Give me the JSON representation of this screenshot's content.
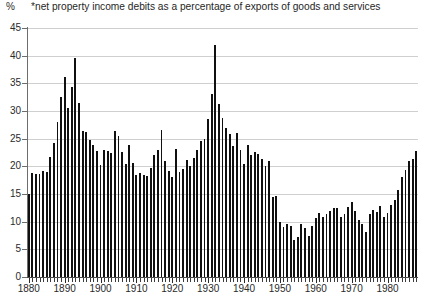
{
  "header": {
    "unit_label": "%",
    "title": "*net property income debits as a percentage of exports of goods and services"
  },
  "axes": {
    "y_ticks": [
      0,
      5,
      10,
      15,
      20,
      25,
      30,
      35,
      40,
      45
    ],
    "x_ticks": [
      1880,
      1890,
      1900,
      1910,
      1920,
      1930,
      1940,
      1950,
      1960,
      1970,
      1980
    ]
  },
  "chart_data": {
    "type": "bar",
    "title": "*net property income debits as a percentage of exports of goods and services",
    "xlabel": "",
    "ylabel": "%",
    "ylim": [
      0,
      45
    ],
    "xlim": [
      1880,
      1989
    ],
    "grid": true,
    "legend": "none",
    "categories": [
      1880,
      1881,
      1882,
      1883,
      1884,
      1885,
      1886,
      1887,
      1888,
      1889,
      1890,
      1891,
      1892,
      1893,
      1894,
      1895,
      1896,
      1897,
      1898,
      1899,
      1900,
      1901,
      1902,
      1903,
      1904,
      1905,
      1906,
      1907,
      1908,
      1909,
      1910,
      1911,
      1912,
      1913,
      1914,
      1915,
      1916,
      1917,
      1918,
      1919,
      1920,
      1921,
      1922,
      1923,
      1924,
      1925,
      1926,
      1927,
      1928,
      1929,
      1930,
      1931,
      1932,
      1933,
      1934,
      1935,
      1936,
      1937,
      1938,
      1939,
      1940,
      1941,
      1942,
      1943,
      1944,
      1945,
      1946,
      1947,
      1948,
      1949,
      1950,
      1951,
      1952,
      1953,
      1954,
      1955,
      1956,
      1957,
      1958,
      1959,
      1960,
      1961,
      1962,
      1963,
      1964,
      1965,
      1966,
      1967,
      1968,
      1969,
      1970,
      1971,
      1972,
      1973,
      1974,
      1975,
      1976,
      1977,
      1978,
      1979,
      1980,
      1981,
      1982,
      1983,
      1984,
      1985,
      1986,
      1987,
      1988
    ],
    "values": [
      15.0,
      18.8,
      18.6,
      18.7,
      19.2,
      19.0,
      21.7,
      24.2,
      28.0,
      32.5,
      36.2,
      30.5,
      34.3,
      39.5,
      31.5,
      26.3,
      26.2,
      24.8,
      23.9,
      22.7,
      20.3,
      23.0,
      22.7,
      22.4,
      26.3,
      25.5,
      22.6,
      20.5,
      23.9,
      20.6,
      18.5,
      18.8,
      18.5,
      18.3,
      19.7,
      22.0,
      22.9,
      26.5,
      21.0,
      19.2,
      18.0,
      23.1,
      19.0,
      19.6,
      21.1,
      20.0,
      21.5,
      23.0,
      24.5,
      25.0,
      28.5,
      33.0,
      42.0,
      31.2,
      28.8,
      27.0,
      25.8,
      23.7,
      26.0,
      23.0,
      20.4,
      23.8,
      22.0,
      22.6,
      22.2,
      21.3,
      20.0,
      21.0,
      14.5,
      14.6,
      10.0,
      9.0,
      9.6,
      9.3,
      6.6,
      7.2,
      9.5,
      8.9,
      7.4,
      9.2,
      10.7,
      11.6,
      10.9,
      11.3,
      12.0,
      12.5,
      12.4,
      10.9,
      11.4,
      12.7,
      13.6,
      12.0,
      10.3,
      9.6,
      8.1,
      11.4,
      12.1,
      11.8,
      12.9,
      10.8,
      11.6,
      13.0,
      14.0,
      15.8,
      18.0,
      19.4,
      21.0,
      21.4,
      22.8
    ]
  }
}
